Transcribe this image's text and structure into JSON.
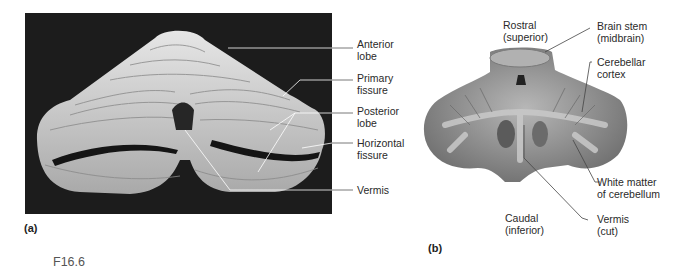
{
  "figure": {
    "id": "F16.6",
    "panels": [
      {
        "tag": "(a)",
        "description": "Posterior view of cerebellum photograph",
        "labels": [
          {
            "line1": "Anterior",
            "line2": "lobe"
          },
          {
            "line1": "Primary",
            "line2": "fissure"
          },
          {
            "line1": "Posterior",
            "line2": "lobe"
          },
          {
            "line1": "Horizontal",
            "line2": "fissure"
          },
          {
            "line1": "Vermis",
            "line2": ""
          }
        ]
      },
      {
        "tag": "(b)",
        "description": "Cross section of cerebellum",
        "labels": {
          "rostral": {
            "line1": "Rostral",
            "line2": "(superior)"
          },
          "brain_stem": {
            "line1": "Brain stem",
            "line2": "(midbrain)"
          },
          "cortex": {
            "line1": "Cerebellar",
            "line2": "cortex"
          },
          "white_matter": {
            "line1": "White matter",
            "line2": "of cerebellum"
          },
          "caudal": {
            "line1": "Caudal",
            "line2": "(inferior)"
          },
          "vermis": {
            "line1": "Vermis",
            "line2": "(cut)"
          }
        }
      }
    ]
  },
  "colors": {
    "photo_bg": "#1c1c1c",
    "tissue_light": "#d8d8d8",
    "section_tissue": "#8a8a8a",
    "leader_line": "#333333"
  }
}
